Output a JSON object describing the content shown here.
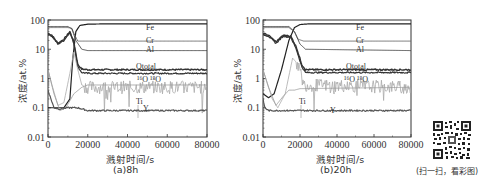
{
  "figure": {
    "qr_caption": "(扫一扫，看彩图)"
  },
  "chart_data": [
    {
      "type": "line",
      "panel": "a",
      "caption": "(a)8h",
      "xlabel": "溅射时间/s",
      "ylabel": "浓度/at.%",
      "xlim": [
        0,
        80000
      ],
      "ylim": [
        0.01,
        100
      ],
      "yscale": "log",
      "xticks": [
        0,
        20000,
        40000,
        60000,
        80000
      ],
      "xtick_labels": [
        "0",
        "20000",
        "40000",
        "60000",
        "80000"
      ],
      "yticks": [
        0.01,
        0.1,
        1,
        10,
        100
      ],
      "ytick_labels": [
        "0.01",
        "0.1",
        "1",
        "10",
        "100"
      ],
      "grid": false,
      "legend": "inline labels",
      "series": [
        {
          "name": "Fe",
          "label": "Fe",
          "color": "#222222",
          "width": 1.2,
          "x": [
            0,
            8000,
            11000,
            12500,
            14000,
            16000,
            20000,
            30000,
            80000
          ],
          "y": [
            0.1,
            0.1,
            0.2,
            5,
            40,
            65,
            72,
            74,
            74
          ]
        },
        {
          "name": "Cr",
          "label": "Cr",
          "color": "#666666",
          "width": 0.9,
          "x": [
            0,
            10000,
            12000,
            13500,
            15000,
            20000,
            80000
          ],
          "y": [
            55,
            55,
            52,
            30,
            19,
            19,
            19
          ]
        },
        {
          "name": "Al",
          "label": "Al",
          "color": "#444444",
          "width": 0.9,
          "x": [
            0,
            10000,
            12000,
            14000,
            17000,
            20000,
            80000
          ],
          "y": [
            60,
            60,
            50,
            20,
            10,
            9,
            9
          ]
        },
        {
          "name": "Ototal",
          "label": "Ototal",
          "color": "#333333",
          "width": 1.4,
          "x": [
            0,
            2000,
            5000,
            8000,
            11000,
            13000,
            15000,
            17000,
            20000,
            80000
          ],
          "y": [
            35,
            30,
            16,
            22,
            40,
            18,
            3,
            2.1,
            2.0,
            2.0
          ]
        },
        {
          "name": "16O",
          "label": "¹⁶O",
          "color": "#333333",
          "width": 1.2,
          "x": [
            0,
            2000,
            5000,
            8000,
            11000,
            13000,
            15000,
            17000,
            20000,
            80000
          ],
          "y": [
            33,
            28,
            15,
            20,
            38,
            16,
            2.5,
            1.6,
            1.5,
            1.5
          ]
        },
        {
          "name": "18O",
          "label": "¹⁸O",
          "color": "#aaaaaa",
          "width": 0.8,
          "x": [
            0,
            2000,
            5000,
            8000,
            11000,
            13000,
            15000,
            17000,
            20000,
            80000
          ],
          "y": [
            2.0,
            0.6,
            0.12,
            0.15,
            1.5,
            8,
            2,
            0.6,
            0.5,
            0.5
          ],
          "noisy": true
        },
        {
          "name": "Ti",
          "label": "Ti",
          "color": "#999999",
          "width": 0.8,
          "x": [
            0,
            3000,
            6000,
            9000,
            13000,
            17000,
            20000,
            80000
          ],
          "y": [
            2,
            0.3,
            0.08,
            0.1,
            0.3,
            0.5,
            0.6,
            0.6
          ]
        },
        {
          "name": "Y",
          "label": "Y",
          "color": "#555555",
          "width": 1.2,
          "x": [
            0,
            1000,
            3000,
            6000,
            10000,
            15000,
            20000,
            80000
          ],
          "y": [
            0.4,
            0.25,
            0.1,
            0.09,
            0.1,
            0.1,
            0.08,
            0.08
          ]
        }
      ]
    },
    {
      "type": "line",
      "panel": "b",
      "caption": "(b)20h",
      "xlabel": "溅射时间/s",
      "ylabel": "浓度/at.%",
      "xlim": [
        0,
        80000
      ],
      "ylim": [
        0.01,
        100
      ],
      "yscale": "log",
      "xticks": [
        0,
        20000,
        40000,
        60000,
        80000
      ],
      "xtick_labels": [
        "0",
        "20000",
        "40000",
        "60000",
        "80000"
      ],
      "yticks": [
        0.01,
        0.1,
        1,
        10,
        100
      ],
      "ytick_labels": [
        "0.01",
        "0.1",
        "1",
        "10",
        "100"
      ],
      "grid": false,
      "legend": "inline labels",
      "series": [
        {
          "name": "Fe",
          "label": "Fe",
          "color": "#222222",
          "width": 1.2,
          "x": [
            0,
            3000,
            6000,
            10000,
            14000,
            17000,
            20000,
            25000,
            80000
          ],
          "y": [
            0.3,
            0.22,
            0.3,
            2,
            20,
            55,
            70,
            74,
            74
          ]
        },
        {
          "name": "Cr",
          "label": "Cr",
          "color": "#666666",
          "width": 0.9,
          "x": [
            0,
            14000,
            17000,
            19000,
            22000,
            80000
          ],
          "y": [
            55,
            55,
            40,
            22,
            19,
            19
          ]
        },
        {
          "name": "Al",
          "label": "Al",
          "color": "#444444",
          "width": 0.9,
          "x": [
            0,
            14000,
            17000,
            20000,
            23000,
            80000
          ],
          "y": [
            60,
            60,
            40,
            15,
            10,
            9
          ]
        },
        {
          "name": "Ototal",
          "label": "Ototal",
          "color": "#333333",
          "width": 1.4,
          "x": [
            0,
            3000,
            7000,
            11000,
            15000,
            18000,
            21000,
            23000,
            80000
          ],
          "y": [
            35,
            30,
            18,
            30,
            28,
            12,
            3,
            2.0,
            2.0
          ]
        },
        {
          "name": "16O",
          "label": "¹⁶O",
          "color": "#333333",
          "width": 1.2,
          "x": [
            0,
            3000,
            7000,
            11000,
            15000,
            18000,
            21000,
            23000,
            80000
          ],
          "y": [
            32,
            28,
            16,
            28,
            26,
            10,
            2.5,
            1.6,
            1.6
          ]
        },
        {
          "name": "18O",
          "label": "¹⁸O",
          "color": "#aaaaaa",
          "width": 0.8,
          "x": [
            0,
            2000,
            5000,
            8000,
            12000,
            16000,
            19000,
            22000,
            80000
          ],
          "y": [
            2.0,
            0.8,
            0.2,
            0.1,
            0.3,
            5,
            3,
            0.6,
            0.5
          ],
          "noisy": true
        },
        {
          "name": "Ti",
          "label": "Ti",
          "color": "#999999",
          "width": 0.8,
          "x": [
            0,
            3000,
            7000,
            11000,
            14000,
            17000,
            20000,
            80000
          ],
          "y": [
            2,
            0.5,
            0.12,
            0.25,
            0.4,
            0.4,
            0.45,
            0.5
          ]
        },
        {
          "name": "Y",
          "label": "Y",
          "color": "#555555",
          "width": 1.2,
          "x": [
            0,
            1000,
            3000,
            8000,
            15000,
            20000,
            80000
          ],
          "y": [
            0.2,
            0.1,
            0.08,
            0.08,
            0.08,
            0.08,
            0.08
          ]
        }
      ]
    }
  ]
}
